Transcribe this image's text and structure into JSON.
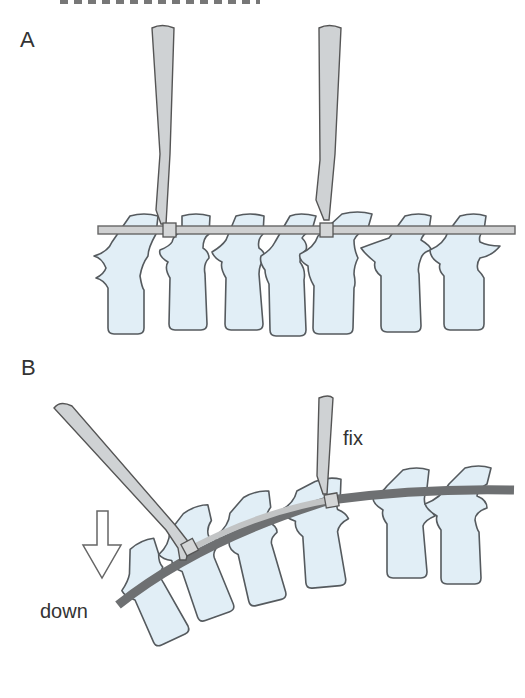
{
  "figure": {
    "header_fragment": "(cut-off caption text)",
    "panels": [
      {
        "id": "A",
        "label": "A",
        "description": "Straight rod across seven vertebrae held by two instruments at clamp points"
      },
      {
        "id": "B",
        "label": "B",
        "annotations": {
          "fix": "fix",
          "down": "down"
        },
        "description": "Curved rod; right instrument fixed, left instrument pushed down to create curvature"
      }
    ],
    "colors": {
      "vertebra_fill": "#e1eef6",
      "outline": "#555a5e",
      "instrument": "#cfd2d4",
      "rod_dark": "#6e7072",
      "text": "#333333"
    }
  }
}
